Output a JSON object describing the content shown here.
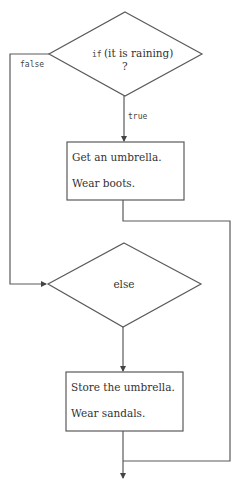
{
  "diagram": {
    "type": "flowchart",
    "decision1": {
      "keyword": "if",
      "condition": "(it is raining)",
      "mark": "?"
    },
    "branch_true_label": "true",
    "branch_false_label": "false",
    "process1": {
      "line1": "Get an umbrella.",
      "line2": "Wear boots."
    },
    "decision2": {
      "label": "else"
    },
    "process2": {
      "line1": "Store the umbrella.",
      "line2": "Wear sandals."
    },
    "line_color": "#5a5a5a",
    "background": "#ffffff"
  }
}
